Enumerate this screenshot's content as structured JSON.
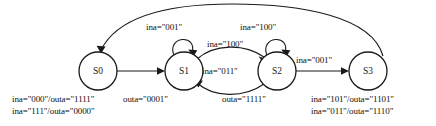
{
  "diagram": {
    "type": "finite-state-machine",
    "title": "",
    "states": [
      {
        "id": "S0",
        "label": "S0",
        "cx": 98,
        "cy": 71,
        "r": 19
      },
      {
        "id": "S1",
        "label": "S1",
        "cx": 184,
        "cy": 71,
        "r": 19
      },
      {
        "id": "S2",
        "label": "S2",
        "cx": 277,
        "cy": 71,
        "r": 19
      },
      {
        "id": "S3",
        "label": "S3",
        "cx": 368,
        "cy": 71,
        "r": 19
      }
    ],
    "state_output_labels": [
      {
        "state": "S0",
        "lines": [
          "ina=\"000\"/outa=\"1111\"",
          "ina=\"111\"/outa=\"0000\""
        ]
      },
      {
        "state": "S1",
        "lines": [
          "outa=\"0001\""
        ]
      },
      {
        "state": "S2",
        "lines": [
          "outa=\"1111\""
        ]
      },
      {
        "state": "S3",
        "lines": [
          "ina=\"101\"/outa=\"1101\"",
          "ina=\"011\"/outa=\"1110\""
        ]
      }
    ],
    "transitions": [
      {
        "from": "S0",
        "to": "S1",
        "label": "",
        "shape": "straight"
      },
      {
        "from": "S1",
        "to": "S1",
        "label": "ina=\"001\"",
        "shape": "self-loop"
      },
      {
        "from": "S1",
        "to": "S2",
        "label": "ina=\"100\"",
        "shape": "arc-above"
      },
      {
        "from": "S2",
        "to": "S1",
        "label": "ina=\"011\"",
        "shape": "arc-below"
      },
      {
        "from": "S2",
        "to": "S2",
        "label": "ina=\"100\"",
        "shape": "self-loop"
      },
      {
        "from": "S2",
        "to": "S3",
        "label": "ina=\"001\"",
        "shape": "straight"
      },
      {
        "from": "S3",
        "to": "S0",
        "label": "",
        "shape": "long-arc-over-top"
      }
    ]
  },
  "colors": {
    "stroke": "#1a1a1a",
    "text": "#111111",
    "background": "#ffffff"
  }
}
